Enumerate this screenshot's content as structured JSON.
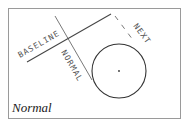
{
  "diagram": {
    "caption": "Normal",
    "labels": {
      "baseline": "BASELINE",
      "normal": "NORMAL",
      "next": "NEXT"
    },
    "colors": {
      "line": "#444444",
      "frame": "#9a9a9a",
      "text": "#555555"
    }
  }
}
